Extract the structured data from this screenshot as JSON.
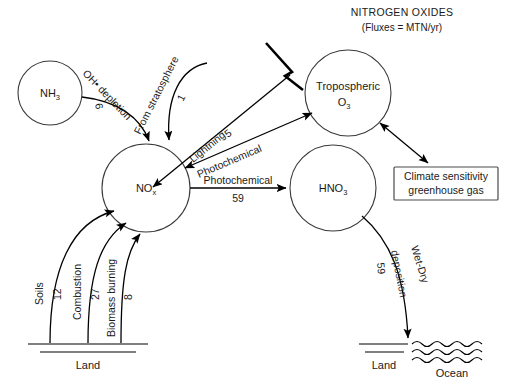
{
  "header": {
    "title": "NITROGEN OXIDES",
    "subtitle": "(Fluxes = MTN/yr)"
  },
  "nodes": {
    "nh3": {
      "label": "NH",
      "sub": "3"
    },
    "nox": {
      "label": "NO",
      "sub": "x"
    },
    "hno3": {
      "label": "HNO",
      "sub": "3"
    },
    "o3": {
      "label_line1": "Tropospheric",
      "label_line2": "O",
      "sub": "3"
    }
  },
  "box": {
    "line1": "Climate sensitivity",
    "line2": "greenhouse gas"
  },
  "flows": {
    "oh_depletion": {
      "label": "OH• depletion",
      "value": "6"
    },
    "stratosphere": {
      "label": "From stratosphere",
      "value": "1"
    },
    "lightning": {
      "label": "Lightning",
      "value": "5"
    },
    "photochemical_o3": {
      "label": "Photochemical",
      "value": ""
    },
    "photochemical_hno3": {
      "label": "Photochemical",
      "value": "59"
    },
    "wet_dry": {
      "label_line1": "Wet-Dry",
      "label_line2": "deposition",
      "value": "59"
    },
    "soils": {
      "label": "Soils",
      "value": "12"
    },
    "combustion": {
      "label": "Combustion",
      "value": "27"
    },
    "biomass": {
      "label": "Biomass burning",
      "value": "8"
    }
  },
  "ground": {
    "land_left": "Land",
    "land_right": "Land",
    "ocean": "Ocean"
  },
  "colors": {
    "stroke": "#000000",
    "circle_stroke": "#3a3a3a",
    "box_stroke": "#4a4a4a",
    "text": "#1a1a1a",
    "background": "#ffffff"
  }
}
